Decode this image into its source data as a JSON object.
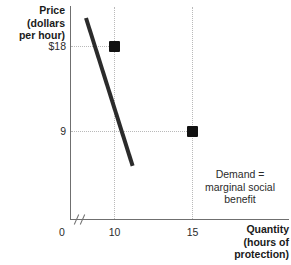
{
  "chart_data": {
    "type": "line",
    "title": "",
    "subtitle": "",
    "xlabel": "Quantity (hours of protection)",
    "ylabel": "Price (dollars per hour)",
    "xlabel_lines": [
      "Quantity",
      "(hours of",
      "protection)"
    ],
    "ylabel_lines": [
      "Price (dollars",
      "per hour)"
    ],
    "x": [
      10,
      15
    ],
    "values": [
      18,
      9
    ],
    "series": [
      {
        "name": "Demand = marginal social benefit",
        "x": [
          10,
          15
        ],
        "values": [
          18,
          9
        ]
      }
    ],
    "xticks": [
      "0",
      "10",
      "15"
    ],
    "xtick_values": [
      0,
      10,
      15
    ],
    "yticks": [
      "$18",
      "9"
    ],
    "ytick_values": [
      18,
      9
    ],
    "xlim": [
      0,
      21
    ],
    "ylim": [
      0,
      24
    ],
    "grid": true,
    "grid_style": "dotted",
    "legend": "none",
    "axis_break": true,
    "annotations": [
      {
        "name": "curve-label",
        "text_lines": [
          "Demand =",
          "marginal social",
          "benefit"
        ],
        "text": "Demand = marginal social benefit"
      }
    ],
    "markers": [
      {
        "name": "point-a",
        "x": 10,
        "y": 18,
        "shape": "square"
      },
      {
        "name": "point-b",
        "x": 15,
        "y": 9,
        "shape": "square"
      }
    ],
    "colors": {
      "curve": "#2b2b2b",
      "marker": "#111111",
      "axis": "#6f6f6f",
      "grid": "#b9b9b9",
      "text": "#1a1a1a",
      "background": "#ffffff"
    }
  },
  "axis": {
    "y_title": "Price (dollars\nper hour)",
    "y_title_line1": "Price (dollars",
    "y_title_line2": "per hour)",
    "x_title_line1": "Quantity",
    "x_title_line2": "(hours of",
    "x_title_line3": "protection)",
    "ytick_18": "$18",
    "ytick_9": "9",
    "xtick_0": "0",
    "xtick_10": "10",
    "xtick_15": "15"
  },
  "curve": {
    "label_line1": "Demand =",
    "label_line2": "marginal social",
    "label_line3": "benefit"
  }
}
